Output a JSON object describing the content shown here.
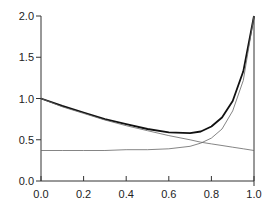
{
  "chart_data": {
    "type": "line",
    "title": "",
    "xlabel": "",
    "ylabel": "",
    "xlim": [
      0.0,
      1.0
    ],
    "ylim": [
      0.0,
      2.0
    ],
    "grid": false,
    "legend": null,
    "x_ticks": [
      "0.0",
      "0.2",
      "0.4",
      "0.6",
      "0.8",
      "1.0"
    ],
    "y_ticks": [
      "0.0",
      "0.5",
      "1.0",
      "1.5",
      "2.0"
    ],
    "x": [
      0.0,
      0.1,
      0.2,
      0.3,
      0.4,
      0.5,
      0.6,
      0.7,
      0.75,
      0.8,
      0.85,
      0.9,
      0.95,
      1.0
    ],
    "series": [
      {
        "name": "total",
        "style": "solid-thick",
        "values": [
          1.0,
          0.91,
          0.83,
          0.75,
          0.69,
          0.63,
          0.59,
          0.58,
          0.6,
          0.66,
          0.77,
          0.97,
          1.33,
          2.0
        ]
      },
      {
        "name": "decreasing component",
        "style": "thin",
        "values": [
          1.0,
          0.9,
          0.82,
          0.74,
          0.67,
          0.61,
          0.55,
          0.5,
          0.47,
          0.45,
          0.43,
          0.41,
          0.39,
          0.37
        ]
      },
      {
        "name": "rising component",
        "style": "thin",
        "values": [
          0.37,
          0.37,
          0.37,
          0.37,
          0.38,
          0.38,
          0.39,
          0.42,
          0.46,
          0.52,
          0.63,
          0.85,
          1.22,
          2.0
        ]
      }
    ]
  }
}
